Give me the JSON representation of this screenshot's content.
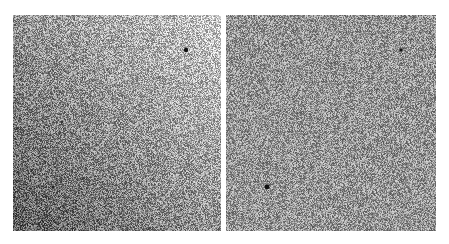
{
  "figure": {
    "background": "#ffffff",
    "panels": [
      {
        "id": "left",
        "x": 13,
        "y": 15,
        "width": 208,
        "height": 216,
        "noise": {
          "type": "gradient",
          "dark": 95,
          "light": 200,
          "amplitude": 70
        },
        "spots": [
          {
            "x": 173,
            "y": 35,
            "r": 2.2,
            "color": "#111111"
          },
          {
            "x": 49,
            "y": 107,
            "r": 1.2,
            "color": "#333333"
          },
          {
            "x": 40,
            "y": 172,
            "r": 1.6,
            "color": "#222222"
          }
        ]
      },
      {
        "id": "right",
        "x": 226,
        "y": 15,
        "width": 210,
        "height": 216,
        "noise": {
          "type": "uniform",
          "mean": 150,
          "amplitude": 65
        },
        "spots": [
          {
            "x": 175,
            "y": 35,
            "r": 1.8,
            "color": "#111111"
          },
          {
            "x": 41,
            "y": 172,
            "r": 2.4,
            "color": "#111111"
          }
        ]
      }
    ]
  }
}
